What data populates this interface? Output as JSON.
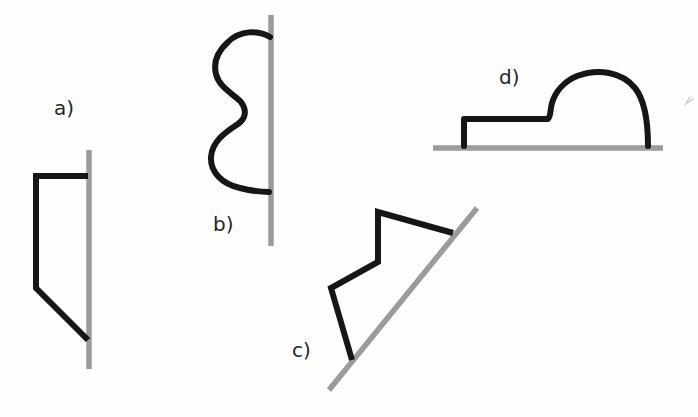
{
  "colors": {
    "ink": "#161616",
    "surface": "#9b9b9b",
    "background": "#fdfdfd",
    "label": "#262626",
    "stray": "#c6c6c6"
  },
  "figures": [
    {
      "label": "a)",
      "surface_d": "M 89 150 L 89 369",
      "shape_d": "M 88 176 L 36 176 L 36 288 L 88 340"
    },
    {
      "label": "b)",
      "surface_d": "M 271 15 L 271 246",
      "shape_d": "M 270 37 C 258 30 240 30 228 42 C 218 51 213 62 216 74 C 219 87 232 93 241 102 C 247 110 246 118 238 124 C 224 133 212 142 211 157 C 210 172 222 184 240 188 C 252 191 262 192 269 192"
    },
    {
      "label": "c)",
      "surface_d": "M 329 390 L 477 208",
      "shape_d": "M 453 233 L 378 212 L 378 262 L 331 288 L 352 360"
    },
    {
      "label": "d)",
      "surface_d": "M 433 148 L 663 148",
      "shape_d": "M 464 146 L 464 119 L 548 119 C 551 116 550 110 552 103 C 555 93 563 82 577 76 C 598 68 622 72 635 88 C 643 98 648 115 648 146"
    }
  ],
  "stray_mark_d": "M 685 105 L 690 97 M 687 103 L 693 99"
}
